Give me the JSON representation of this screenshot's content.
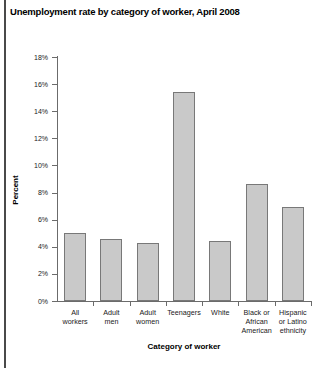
{
  "chart_data": {
    "type": "bar",
    "title": "Unemployment rate by category of worker, April 2008",
    "xlabel": "Category of worker",
    "ylabel": "Percent",
    "categories": [
      "All workers",
      "Adult men",
      "Adult women",
      "Teenagers",
      "White",
      "Black or African American",
      "Hispanic or Latino ethnicity"
    ],
    "category_lines": [
      [
        "All",
        "workers"
      ],
      [
        "Adult",
        "men"
      ],
      [
        "Adult",
        "women"
      ],
      [
        "Teenagers"
      ],
      [
        "White"
      ],
      [
        "Black or",
        "African",
        "American"
      ],
      [
        "Hispanic",
        "or Latino",
        "ethnicity"
      ]
    ],
    "values": [
      5.0,
      4.6,
      4.3,
      15.4,
      4.4,
      8.6,
      6.9
    ],
    "ylim": [
      0,
      18
    ],
    "ytick_labels": [
      "0%",
      "2%",
      "4%",
      "6%",
      "8%",
      "10%",
      "12%",
      "14%",
      "16%",
      "18%"
    ],
    "ytick_values": [
      0,
      2,
      4,
      6,
      8,
      10,
      12,
      14,
      16,
      18
    ],
    "grid": false,
    "legend": null,
    "bar_color": "#c9c9c9",
    "bar_border_color": "#787878",
    "axis_color": "#6b6b6b"
  },
  "footnote": ""
}
